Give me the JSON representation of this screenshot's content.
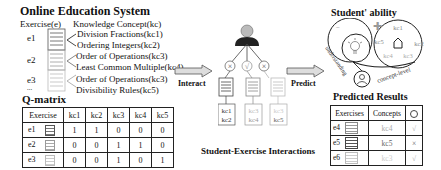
{
  "left": {
    "title": "Online Education System",
    "exercise_header": "Exercise(e)",
    "kc_header": "Knowledge Concept(kc)",
    "exercises": [
      {
        "label": "e1",
        "concepts": [
          "Division Fractions(kc1)",
          "Ordering Integers(kc2)"
        ]
      },
      {
        "label": "e2",
        "concepts": [
          "Order of Operations(kc3)",
          "Least Common Multiple(kc4)"
        ]
      },
      {
        "label": "e3",
        "concepts": [
          "Order of Operations(kc3)",
          "Divisibility Rules(kc5)"
        ]
      }
    ],
    "ellipsis": "..."
  },
  "qmatrix": {
    "title": "Q-matrix",
    "headers": [
      "Exercise",
      "kc1",
      "kc2",
      "kc3",
      "kc4",
      "kc5"
    ],
    "rows": [
      {
        "exercise": "e1",
        "values": [
          "1",
          "1",
          "0",
          "0",
          "0"
        ]
      },
      {
        "exercise": "e2",
        "values": [
          "0",
          "0",
          "1",
          "1",
          "0"
        ]
      },
      {
        "exercise": "e3",
        "values": [
          "0",
          "0",
          "1",
          "0",
          "1"
        ]
      }
    ]
  },
  "middle": {
    "interact_label": "Interact",
    "predict_label": "Predict",
    "caption": "Student-Exercise Interactions",
    "responses": [
      "×",
      "√",
      "×"
    ],
    "kc_boxes": [
      [
        "kc1",
        "kc2"
      ],
      [
        "kc3",
        "kc4"
      ],
      [
        "kc3",
        "kc5"
      ]
    ]
  },
  "ability": {
    "title": "Student' ability",
    "understanding_label": "understanding",
    "concept_level_label": "concept-level",
    "kcs": [
      "kc1",
      "kc2",
      "kc3",
      "kc4",
      "kc5"
    ]
  },
  "predicted": {
    "title": "Predicted Results",
    "headers": [
      "Exercises",
      "Concepts"
    ],
    "rows": [
      {
        "exercise": "e4",
        "concept": "kc4",
        "result": "√"
      },
      {
        "exercise": "e5",
        "concept": "kc5",
        "result": "×"
      },
      {
        "exercise": "e6",
        "concept": "kc3",
        "result": "√"
      }
    ]
  }
}
